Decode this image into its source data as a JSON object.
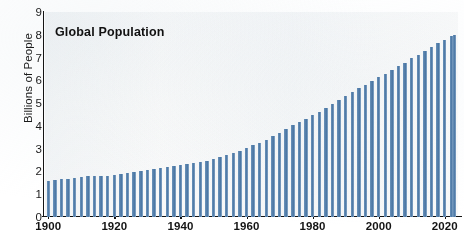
{
  "chart_data": {
    "type": "bar",
    "title": "Global Population",
    "xlabel": "",
    "ylabel": "Billions of People",
    "ylim": [
      0,
      9
    ],
    "xlim": [
      1899,
      2024
    ],
    "grid": false,
    "legend": null,
    "y_ticks": [
      "0",
      "1",
      "2",
      "3",
      "4",
      "5",
      "6",
      "7",
      "8",
      "9"
    ],
    "x_ticks": [
      "1900",
      "1920",
      "1940",
      "1960",
      "1980",
      "2000",
      "2020"
    ],
    "x_tick_values": [
      1900,
      1920,
      1940,
      1960,
      1980,
      2000,
      2020
    ],
    "bar_color": "#5781ac",
    "plot_background": "#fbfbfa",
    "x": [
      1900,
      1902,
      1904,
      1906,
      1908,
      1910,
      1912,
      1914,
      1916,
      1918,
      1920,
      1922,
      1924,
      1926,
      1928,
      1930,
      1932,
      1934,
      1936,
      1938,
      1940,
      1942,
      1944,
      1946,
      1948,
      1950,
      1952,
      1954,
      1956,
      1958,
      1960,
      1962,
      1964,
      1966,
      1968,
      1970,
      1972,
      1974,
      1976,
      1978,
      1980,
      1982,
      1984,
      1986,
      1988,
      1990,
      1992,
      1994,
      1996,
      1998,
      2000,
      2002,
      2004,
      2006,
      2008,
      2010,
      2012,
      2014,
      2016,
      2018,
      2020,
      2022,
      2023
    ],
    "values": [
      1.6,
      1.62,
      1.65,
      1.68,
      1.71,
      1.75,
      1.78,
      1.8,
      1.81,
      1.82,
      1.86,
      1.9,
      1.94,
      1.98,
      2.02,
      2.07,
      2.1,
      2.14,
      2.18,
      2.22,
      2.3,
      2.33,
      2.36,
      2.4,
      2.45,
      2.54,
      2.63,
      2.72,
      2.82,
      2.92,
      3.03,
      3.14,
      3.27,
      3.4,
      3.54,
      3.7,
      3.86,
      4.02,
      4.16,
      4.31,
      4.46,
      4.62,
      4.78,
      4.95,
      5.13,
      5.33,
      5.5,
      5.66,
      5.81,
      5.98,
      6.14,
      6.3,
      6.46,
      6.62,
      6.78,
      6.96,
      7.13,
      7.3,
      7.46,
      7.63,
      7.79,
      7.95,
      8.0
    ]
  }
}
